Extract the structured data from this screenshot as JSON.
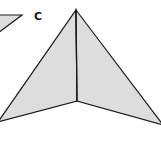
{
  "diagram": {
    "colors": {
      "fill": "#dddddd",
      "stroke": "#1a1a1a",
      "background": "#ffffff"
    },
    "shapes": [
      {
        "id": "small-triangle",
        "type": "polygon",
        "points": [
          [
            -2,
            15
          ],
          [
            22,
            15
          ],
          [
            -2,
            33
          ]
        ]
      },
      {
        "id": "left-face",
        "type": "polygon",
        "points": [
          [
            76,
            10
          ],
          [
            77,
            101
          ],
          [
            -2,
            122
          ]
        ]
      },
      {
        "id": "right-face",
        "type": "polygon",
        "points": [
          [
            76,
            10
          ],
          [
            163,
            125
          ],
          [
            77,
            101
          ]
        ]
      }
    ],
    "edges": [
      {
        "id": "center-fold",
        "from": [
          76,
          10
        ],
        "to": [
          77,
          101
        ]
      }
    ],
    "labels": [
      {
        "id": "label-c",
        "text": "C",
        "x": 34,
        "y": 11
      }
    ]
  }
}
